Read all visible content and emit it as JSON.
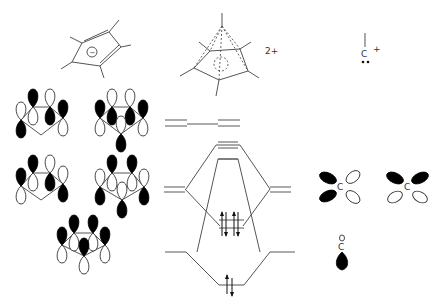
{
  "figure": {
    "labels": {
      "ring_charge": "−",
      "pyramid_charge": "2+",
      "cap_carbon": "C",
      "cap_charge": "+",
      "lobe_carbon_1": "C",
      "lobe_carbon_2": "C",
      "lone_pair_carbon": "C"
    },
    "colors": {
      "lobe_filled": "#000000",
      "lobe_empty": "#ffffff",
      "line": "#555555"
    },
    "mo_diagram": {
      "left_levels": [
        "degenerate e2 pair (top)",
        "degenerate e1 pair (middle)",
        "a1 (bottom)"
      ],
      "center_levels": [
        "antibonding e (top pair)",
        "antibonding a1",
        "bonding e1 (4 electrons)",
        "bonding a1 (2 electrons)"
      ],
      "right_levels": [
        "degenerate p pair",
        "sp lone pair"
      ],
      "electrons": {
        "center_e1": 4,
        "center_a1": 2
      }
    }
  }
}
